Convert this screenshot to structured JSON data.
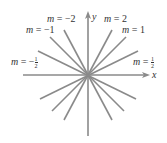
{
  "diagram": {
    "axes": {
      "x_label": "x",
      "y_label": "y"
    },
    "colors": {
      "lines": "#8a8a8a",
      "axes": "#8a8a8a",
      "text": "#333333"
    },
    "labels": [
      {
        "var": "m",
        "eq": " = ",
        "value": "−2"
      },
      {
        "var": "m",
        "eq": " = ",
        "value": "2"
      },
      {
        "var": "m",
        "eq": " = ",
        "value": "−1"
      },
      {
        "var": "m",
        "eq": " = ",
        "value": "1"
      },
      {
        "var": "m",
        "eq": " = −",
        "num": "1",
        "den": "2"
      },
      {
        "var": "m",
        "eq": " = ",
        "num": "1",
        "den": "2"
      }
    ],
    "slopes": [
      2,
      1,
      0.5,
      -2,
      -1,
      -0.5,
      0.25,
      -0.25
    ]
  }
}
